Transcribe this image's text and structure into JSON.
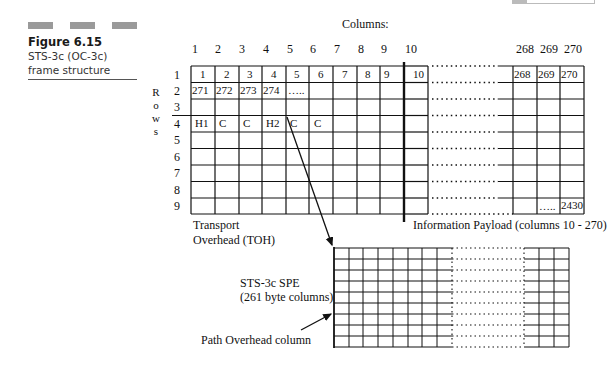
{
  "figure": {
    "number": "Figure 6.15",
    "description": "STS-3c (OC-3c) frame structure"
  },
  "diagram": {
    "columns_heading": "Columns:",
    "column_headers": [
      "1",
      "2",
      "3",
      "4",
      "5",
      "6",
      "7",
      "8",
      "9",
      "10",
      "268",
      "269",
      "270"
    ],
    "rows_label_letters": [
      "R",
      "o",
      "w",
      "s"
    ],
    "row_numbers": [
      "1",
      "2",
      "3",
      "4",
      "5",
      "6",
      "7",
      "8",
      "9"
    ],
    "frame_cells": {
      "row1": [
        "1",
        "2",
        "3",
        "4",
        "5",
        "6",
        "7",
        "8",
        "9",
        "10",
        "268",
        "269",
        "270"
      ],
      "row2": [
        "271",
        "272",
        "273",
        "274",
        "….."
      ],
      "row4": [
        "H1",
        "C",
        "C",
        "H2",
        "C",
        "C"
      ],
      "row9_tail": [
        "…..",
        "2430"
      ]
    },
    "toh_label_line1": "Transport",
    "toh_label_line2": "Overhead (TOH)",
    "payload_label": "Information Payload (columns 10 - 270)",
    "spe_label_line1": "STS-3c SPE",
    "spe_label_line2": "(261 byte columns)",
    "path_overhead_label": "Path Overhead column",
    "colors": {
      "line": "#111111",
      "caption_bar": "#9a9a9a",
      "background": "#ffffff"
    }
  }
}
